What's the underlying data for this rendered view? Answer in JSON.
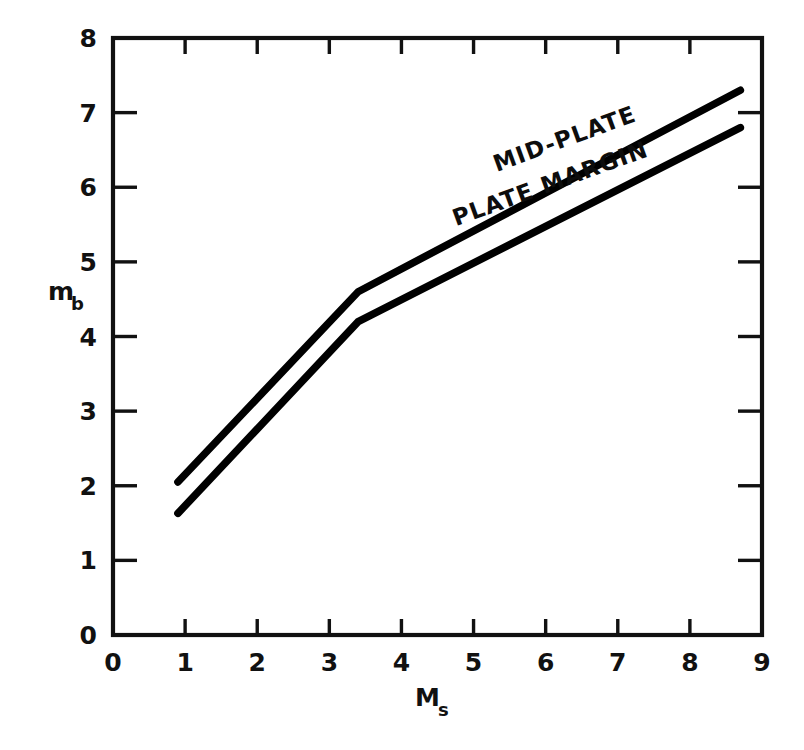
{
  "chart_data": {
    "type": "line",
    "title": "",
    "xlabel": "M_s",
    "xlabel_base": "M",
    "xlabel_sub": "s",
    "ylabel": "m_b",
    "ylabel_base": "m",
    "ylabel_sub": "b",
    "xlim": [
      0,
      9
    ],
    "ylim": [
      0,
      8
    ],
    "xticks": [
      0,
      1,
      2,
      3,
      4,
      5,
      6,
      7,
      8,
      9
    ],
    "yticks": [
      0,
      1,
      2,
      3,
      4,
      5,
      6,
      7,
      8
    ],
    "xticklabels": [
      "0",
      "1",
      "2",
      "3",
      "4",
      "5",
      "6",
      "7",
      "8",
      "9"
    ],
    "yticklabels": [
      "0",
      "1",
      "2",
      "3",
      "4",
      "5",
      "6",
      "7",
      "8"
    ],
    "grid": false,
    "legend_position": "inline-along-curves",
    "line_color": "#000000",
    "series": [
      {
        "name": "MID-PLATE",
        "x": [
          0.9,
          3.4,
          8.7
        ],
        "values": [
          2.05,
          4.6,
          7.3
        ],
        "label_angle_deg": -20
      },
      {
        "name": "PLATE MARGIN",
        "x": [
          0.9,
          3.4,
          8.7
        ],
        "values": [
          1.63,
          4.2,
          6.8
        ],
        "label_angle_deg": -20
      }
    ],
    "annotations": [
      {
        "text": "MID-PLATE",
        "x": 6.3,
        "y": 6.55
      },
      {
        "text": "PLATE MARGIN",
        "x": 6.1,
        "y": 5.95
      }
    ]
  }
}
